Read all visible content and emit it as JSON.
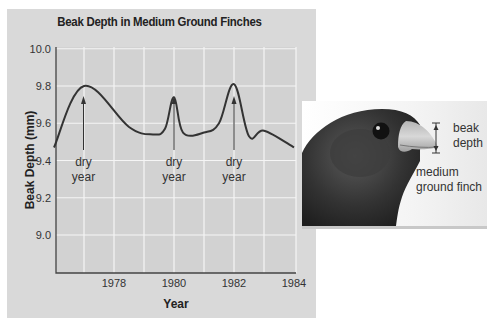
{
  "chart_data": {
    "type": "line",
    "title": "Beak Depth in Medium Ground Finches",
    "xlabel": "Year",
    "ylabel": "Beak Depth (mm)",
    "xlim": [
      1976,
      1984
    ],
    "ylim": [
      8.8,
      10.0
    ],
    "x_ticks": [
      "1978",
      "1980",
      "1982",
      "1984"
    ],
    "y_ticks": [
      "10.0",
      "9.8",
      "9.6",
      "9.4",
      "9.2",
      "9.0"
    ],
    "grid": true,
    "series": [
      {
        "name": "Beak depth",
        "x": [
          1976.0,
          1977.0,
          1978.5,
          1979.3,
          1979.7,
          1980.0,
          1980.3,
          1981.0,
          1981.5,
          1982.0,
          1982.5,
          1983.0,
          1984.0
        ],
        "values": [
          9.47,
          9.8,
          9.58,
          9.54,
          9.57,
          9.74,
          9.55,
          9.55,
          9.6,
          9.81,
          9.53,
          9.56,
          9.47
        ]
      }
    ],
    "annotations": [
      {
        "text_line1": "dry",
        "text_line2": "year",
        "x": 1977.0
      },
      {
        "text_line1": "dry",
        "text_line2": "year",
        "x": 1980.0
      },
      {
        "text_line1": "dry",
        "text_line2": "year",
        "x": 1982.0
      }
    ]
  },
  "illustration": {
    "beak_label_line1": "beak",
    "beak_label_line2": "depth",
    "species_label_line1": "medium",
    "species_label_line2": "ground finch"
  }
}
